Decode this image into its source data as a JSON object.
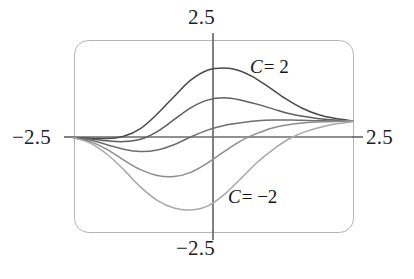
{
  "figure": {
    "name": "parametric-sigmoid-family-plot",
    "frame": {
      "x": 74,
      "y": 40,
      "width": 279,
      "height": 192,
      "corner_radius": 14,
      "stroke": "#b4b4b4",
      "stroke_width": 1
    },
    "axes": {
      "origin_x": 213,
      "origin_y": 137,
      "stroke": "#6b6b6b",
      "stroke_width": 1.6
    }
  },
  "labels": {
    "top": "2.5",
    "bottom": "−2.5",
    "left": "−2.5",
    "right": "2.5"
  },
  "annotations": {
    "c_positive": {
      "symbol": "C",
      "text": "= 2"
    },
    "c_negative": {
      "symbol": "C",
      "text": "= −2"
    }
  },
  "chart_data": {
    "type": "line",
    "title": "",
    "xlabel": "",
    "ylabel": "",
    "xlim": [
      -2.5,
      2.5
    ],
    "ylim": [
      -2.5,
      2.5
    ],
    "xticks": [
      -2.5,
      2.5
    ],
    "yticks": [
      -2.5,
      2.5
    ],
    "xticklabels": [
      "−2.5",
      "2.5"
    ],
    "yticklabels": [
      "−2.5",
      "2.5"
    ],
    "grid": false,
    "legend": "inline-annotations",
    "legend_entries": [
      "C = 2",
      "C = −2"
    ],
    "parameter_name": "C",
    "series": [
      {
        "name": "C = 2",
        "C": 2,
        "color": "#4a4a4a",
        "x": [
          -2.5,
          -2.2,
          -1.9,
          -1.6,
          -1.3,
          -1.0,
          -0.7,
          -0.4,
          -0.1,
          0.2,
          0.45,
          0.7,
          1.0,
          1.3,
          1.6,
          1.9,
          2.2,
          2.5
        ],
        "y": [
          -0.02,
          -0.03,
          -0.04,
          0.02,
          0.22,
          0.6,
          1.05,
          1.48,
          1.74,
          1.8,
          1.74,
          1.58,
          1.3,
          1.0,
          0.75,
          0.58,
          0.48,
          0.42
        ]
      },
      {
        "name": "C = 1",
        "C": 1,
        "color": "#5d5d5d",
        "x": [
          -2.5,
          -2.2,
          -1.9,
          -1.6,
          -1.3,
          -1.0,
          -0.7,
          -0.4,
          -0.1,
          0.2,
          0.5,
          0.8,
          1.1,
          1.4,
          1.7,
          2.0,
          2.3,
          2.5
        ],
        "y": [
          -0.02,
          -0.05,
          -0.1,
          -0.12,
          -0.06,
          0.14,
          0.45,
          0.76,
          0.96,
          1.02,
          0.96,
          0.85,
          0.72,
          0.6,
          0.52,
          0.46,
          0.43,
          0.42
        ]
      },
      {
        "name": "C = 0",
        "C": 0,
        "color": "#6f6f6f",
        "x": [
          -2.5,
          -2.2,
          -1.9,
          -1.6,
          -1.3,
          -1.0,
          -0.7,
          -0.4,
          -0.1,
          0.2,
          0.5,
          0.8,
          1.1,
          1.4,
          1.7,
          2.0,
          2.3,
          2.5
        ],
        "y": [
          -0.02,
          -0.08,
          -0.2,
          -0.32,
          -0.38,
          -0.34,
          -0.2,
          0.0,
          0.18,
          0.3,
          0.37,
          0.42,
          0.44,
          0.44,
          0.43,
          0.42,
          0.42,
          0.42
        ]
      },
      {
        "name": "C = -1",
        "C": -1,
        "color": "#8c8c8c",
        "x": [
          -2.5,
          -2.2,
          -1.9,
          -1.6,
          -1.3,
          -1.0,
          -0.7,
          -0.4,
          -0.1,
          0.2,
          0.5,
          0.8,
          1.1,
          1.4,
          1.7,
          2.0,
          2.3,
          2.5
        ],
        "y": [
          -0.02,
          -0.12,
          -0.32,
          -0.6,
          -0.85,
          -1.0,
          -1.03,
          -0.92,
          -0.68,
          -0.38,
          -0.1,
          0.1,
          0.25,
          0.33,
          0.38,
          0.4,
          0.41,
          0.42
        ]
      },
      {
        "name": "C = -2",
        "C": -2,
        "color": "#a8a8a8",
        "x": [
          -2.5,
          -2.2,
          -1.9,
          -1.6,
          -1.3,
          -1.0,
          -0.7,
          -0.4,
          -0.1,
          0.2,
          0.5,
          0.8,
          1.1,
          1.4,
          1.7,
          2.0,
          2.3,
          2.5
        ],
        "y": [
          -0.02,
          -0.16,
          -0.45,
          -0.85,
          -1.3,
          -1.65,
          -1.85,
          -1.9,
          -1.8,
          -1.5,
          -1.08,
          -0.65,
          -0.3,
          -0.02,
          0.16,
          0.28,
          0.36,
          0.4
        ]
      }
    ]
  }
}
